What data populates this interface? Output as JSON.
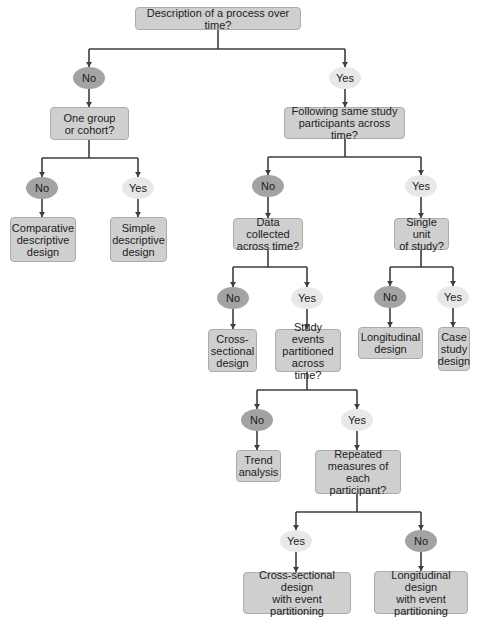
{
  "diagram": {
    "type": "decision-flowchart",
    "colors": {
      "no_oval": "#a3a3a3",
      "yes_oval": "#e8e8e8",
      "box": "#cfcfcf",
      "line": "#3d3d3d"
    },
    "nodes": {
      "root": {
        "label": "Description of a process over time?"
      },
      "n1_no": {
        "label": "No"
      },
      "n1_yes": {
        "label": "Yes"
      },
      "group": {
        "label": "One group\nor cohort?"
      },
      "following": {
        "label": "Following same study\nparticipants across time?"
      },
      "g_no": {
        "label": "No"
      },
      "g_yes": {
        "label": "Yes"
      },
      "comparative": {
        "label": "Comparative\ndescriptive\ndesign"
      },
      "simple": {
        "label": "Simple\ndescriptive\ndesign"
      },
      "f_no": {
        "label": "No"
      },
      "f_yes": {
        "label": "Yes"
      },
      "data_collected": {
        "label": "Data collected\nacross time?"
      },
      "single_unit": {
        "label": "Single unit\nof study?"
      },
      "d_no": {
        "label": "No"
      },
      "d_yes": {
        "label": "Yes"
      },
      "cross_sectional": {
        "label": "Cross-\nsectional\ndesign"
      },
      "study_events": {
        "label": "Study events\npartitioned\nacross time?"
      },
      "s_no": {
        "label": "No"
      },
      "s_yes": {
        "label": "Yes"
      },
      "longitudinal": {
        "label": "Longitudinal\ndesign"
      },
      "case_study": {
        "label": "Case\nstudy\ndesign"
      },
      "e_no": {
        "label": "No"
      },
      "e_yes": {
        "label": "Yes"
      },
      "trend": {
        "label": "Trend\nanalysis"
      },
      "repeated": {
        "label": "Repeated\nmeasures of\neach participant?"
      },
      "r_yes": {
        "label": "Yes"
      },
      "r_no": {
        "label": "No"
      },
      "cs_event": {
        "label": "Cross-sectional design\nwith event\npartitioning"
      },
      "long_event": {
        "label": "Longitudinal design\nwith event\npartitioning"
      }
    }
  }
}
